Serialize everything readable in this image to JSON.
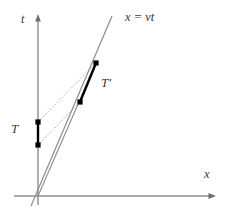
{
  "figure": {
    "background_color": "#ffffff",
    "width": 227,
    "height": 221
  },
  "axes": {
    "vertical": {
      "name": "t",
      "label": "t",
      "color": "#8c8c8c",
      "x": 38,
      "y_top": 16,
      "y_bottom": 205,
      "arrow": "up"
    },
    "horizontal": {
      "name": "x",
      "label": "x",
      "color": "#8c8c8c",
      "y": 196,
      "x_left": 14,
      "x_right": 215,
      "arrow": "right"
    },
    "origin": {
      "x": 38,
      "y": 196
    }
  },
  "worldline": {
    "label": "x = vt",
    "label_parts": {
      "lhs": "x",
      "op": "=",
      "rhs": "vt"
    },
    "color": "#8c8c8c",
    "from": {
      "x": 31,
      "y": 206
    },
    "to": {
      "x": 112,
      "y": 16
    }
  },
  "segments": [
    {
      "id": "T",
      "label": "T",
      "color": "#000000",
      "width": 2.4,
      "from": {
        "x": 38,
        "y": 145
      },
      "to": {
        "x": 38,
        "y": 122
      },
      "endpoint_marker": "filled-square-dot"
    },
    {
      "id": "Tprime",
      "label": "T′",
      "label_base": "T",
      "label_prime": "′",
      "color": "#000000",
      "width": 2.4,
      "from": {
        "x": 80,
        "y": 102
      },
      "to": {
        "x": 96,
        "y": 63
      },
      "endpoint_marker": "filled-square-dot"
    }
  ],
  "connector_lines": [
    {
      "id": "dotted-upper",
      "style": "dotted",
      "color": "#9a9a9a",
      "from": {
        "x": 38,
        "y": 122
      },
      "to": {
        "x": 96,
        "y": 63
      }
    },
    {
      "id": "dotted-lower",
      "style": "dotted",
      "color": "#9a9a9a",
      "from": {
        "x": 38,
        "y": 145
      },
      "to": {
        "x": 80,
        "y": 102
      }
    },
    {
      "id": "ray-from-origin",
      "style": "solid",
      "color": "#8c8c8c",
      "from": {
        "x": 38,
        "y": 196
      },
      "to": {
        "x": 96,
        "y": 63
      }
    }
  ],
  "endpoints": [
    {
      "id": "T-lower",
      "x": 38,
      "y": 145
    },
    {
      "id": "T-upper",
      "x": 38,
      "y": 122
    },
    {
      "id": "Tprime-lower",
      "x": 80,
      "y": 102
    },
    {
      "id": "Tprime-upper",
      "x": 96,
      "y": 63
    }
  ]
}
